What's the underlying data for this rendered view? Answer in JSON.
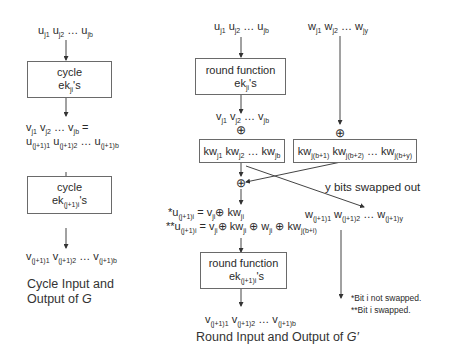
{
  "left_panel": {
    "input_label": "u_j1 u_j2 … u_jb",
    "box1": {
      "line1": "cycle",
      "line2": "ek_ji's"
    },
    "middle_label_line1": "v_j1 v_j2 … v_jb =",
    "middle_label_line2": "u_(j+1)1 u_(j+1)2 … u_(j+1)b",
    "box2": {
      "line1": "cycle",
      "line2": "ek_(j+1)i's"
    },
    "output_label": "v_(j+1)1 v_(j+1)2 … v_(j+1)b",
    "caption_line1": "Cycle Input and",
    "caption_line2": "Output of G"
  },
  "right_panel": {
    "input_label": "u_j1 u_j2 … u_jb",
    "w_input_label": "w_j1 w_j2 … w_jy",
    "box1": {
      "line1": "round function",
      "line2": "ek_ji's"
    },
    "v_label": "v_j1 v_j2 … v_jb",
    "xor_symbol": "⊕",
    "kw_box_left": "kw_j1 kw_j2 … kw_jb",
    "kw_box_right": "kw_j(b+1) kw_j(b+2) … kw_j(b+y)",
    "swap_label": "y bits swapped out",
    "w_output_label": "w_(j+1)1 w_(j+1)2 … w_(j+1)y",
    "eq_not_swapped": "*u_(j+1)i = v_ji ⊕ kw_ji",
    "eq_swapped": "**u_(j+1)i = v_ji ⊕ kw_ji ⊕ w_ji ⊕ kw_j(b+i)",
    "box2": {
      "line1": "round function",
      "line2": "ek_(j+1)i's"
    },
    "output_label": "v_(j+1)1 v_(j+1)2 … v_(j+1)b",
    "caption": "Round Input and Output of G′",
    "footnote1": "*Bit i not swapped.",
    "footnote2": "**Bit i swapped."
  }
}
